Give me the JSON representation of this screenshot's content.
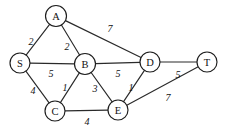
{
  "diagram": {
    "colors": {
      "background": "#ffffff",
      "stroke": "#1d1d1d",
      "edge": "#2a2a2a",
      "text": "#111111"
    },
    "nodes": [
      {
        "id": "S",
        "label": "S",
        "x": 20,
        "y": 63,
        "r": 10
      },
      {
        "id": "A",
        "label": "A",
        "x": 56,
        "y": 16,
        "r": 10.5
      },
      {
        "id": "B",
        "label": "B",
        "x": 85,
        "y": 64,
        "r": 10.5
      },
      {
        "id": "C",
        "label": "C",
        "x": 55,
        "y": 111,
        "r": 10
      },
      {
        "id": "D",
        "label": "D",
        "x": 150,
        "y": 62,
        "r": 10
      },
      {
        "id": "E",
        "label": "E",
        "x": 118,
        "y": 110,
        "r": 10
      },
      {
        "id": "T",
        "label": "T",
        "x": 207,
        "y": 62,
        "r": 10
      }
    ],
    "edges": [
      {
        "id": "S-A",
        "from": "S",
        "to": "A",
        "weight": "2",
        "lx": 31,
        "ly": 41
      },
      {
        "id": "A-B",
        "from": "A",
        "to": "B",
        "weight": "2",
        "lx": 67,
        "ly": 46
      },
      {
        "id": "A-D",
        "from": "A",
        "to": "D",
        "weight": "7",
        "lx": 110,
        "ly": 28
      },
      {
        "id": "S-B",
        "from": "S",
        "to": "B",
        "weight": "5",
        "lx": 51,
        "ly": 73
      },
      {
        "id": "S-C",
        "from": "S",
        "to": "C",
        "weight": "4",
        "lx": 33,
        "ly": 90
      },
      {
        "id": "B-C",
        "from": "B",
        "to": "C",
        "weight": "1",
        "lx": 65,
        "ly": 87
      },
      {
        "id": "B-E",
        "from": "B",
        "to": "E",
        "weight": "3",
        "lx": 95,
        "ly": 88
      },
      {
        "id": "B-D",
        "from": "B",
        "to": "D",
        "weight": "5",
        "lx": 118,
        "ly": 73
      },
      {
        "id": "D-E",
        "from": "D",
        "to": "E",
        "weight": "1",
        "lx": 131,
        "ly": 87
      },
      {
        "id": "C-E",
        "from": "C",
        "to": "E",
        "weight": "4",
        "lx": 87,
        "ly": 121
      },
      {
        "id": "D-T",
        "from": "D",
        "to": "T",
        "weight": "5",
        "lx": 178,
        "ly": 74
      },
      {
        "id": "E-T",
        "from": "E",
        "to": "T",
        "weight": "7",
        "lx": 168,
        "ly": 97
      }
    ]
  }
}
